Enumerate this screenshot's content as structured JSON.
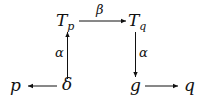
{
  "diagram": {
    "type": "commutative-diagram",
    "nodes": {
      "Tp": {
        "base": "T",
        "sub": "p"
      },
      "Tq": {
        "base": "T",
        "sub": "q"
      },
      "p": {
        "label": "p"
      },
      "delta": {
        "label": "δ"
      },
      "g": {
        "label": "g"
      },
      "q": {
        "label": "q"
      }
    },
    "edges": [
      {
        "from": "Tp",
        "to": "Tq",
        "label": "β"
      },
      {
        "from": "delta",
        "to": "Tp",
        "label": "α"
      },
      {
        "from": "Tq",
        "to": "g",
        "label": "α"
      },
      {
        "from": "delta",
        "to": "p",
        "label": ""
      },
      {
        "from": "g",
        "to": "q",
        "label": ""
      }
    ]
  }
}
